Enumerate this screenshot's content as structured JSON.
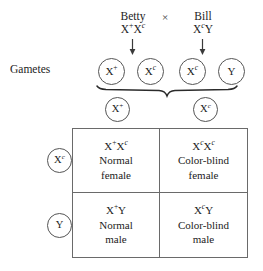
{
  "diagram": {
    "side_label": "Gametes",
    "cross_symbol": "×",
    "parents": [
      {
        "name": "Betty",
        "genotype_html": "X<sup>+</sup>X<span class=\"sup-c\">c</span>"
      },
      {
        "name": "Bill",
        "genotype_html": "X<span class=\"sup-c\">c</span>Y"
      }
    ],
    "gametes_row": [
      {
        "label_html": "X<sup>+</sup>",
        "parent": "Betty"
      },
      {
        "label_html": "X<span class=\"sup-c\">c</span>",
        "parent": "Betty"
      },
      {
        "label_html": "X<span class=\"sup-c\">c</span>",
        "parent": "Bill"
      },
      {
        "label_html": "Y",
        "parent": "Bill"
      }
    ],
    "column_headers": [
      {
        "label_html": "X<sup>+</sup>"
      },
      {
        "label_html": "X<span class=\"sup-c\">c</span>"
      }
    ],
    "row_headers": [
      {
        "label_html": "X<span class=\"sup-c\">c</span>"
      },
      {
        "label_html": "Y"
      }
    ],
    "punnett_cells": [
      {
        "genotype_html": "X<sup>+</sup>X<span class=\"sup-c\">c</span>",
        "phenotype_line1": "Normal",
        "phenotype_line2": "female"
      },
      {
        "genotype_html": "X<span class=\"sup-c\">c</span>X<span class=\"sup-c\">c</span>",
        "phenotype_line1": "Color-blind",
        "phenotype_line2": "female"
      },
      {
        "genotype_html": "X<sup>+</sup>Y",
        "phenotype_line1": "Normal",
        "phenotype_line2": "male"
      },
      {
        "genotype_html": "X<span class=\"sup-c\">c</span>Y",
        "phenotype_line1": "Color-blind",
        "phenotype_line2": "male"
      }
    ],
    "colors": {
      "background": "#ffffff",
      "text": "#1c1c1c",
      "line": "#6a6a6a",
      "circle_stroke": "#555555"
    }
  }
}
